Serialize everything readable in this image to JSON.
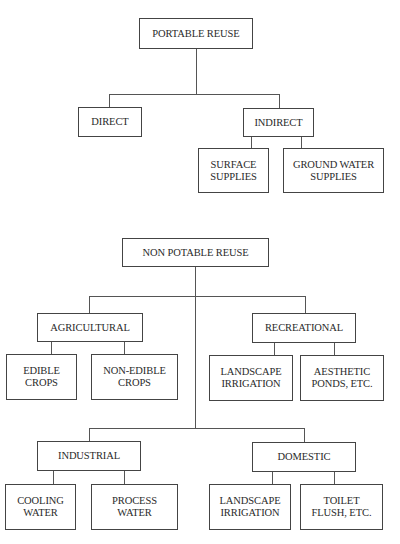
{
  "potable": {
    "root": "PORTABLE REUSE",
    "direct": "DIRECT",
    "indirect": "INDIRECT",
    "surface_supplies": "SURFACE\nSUPPLIES",
    "ground_water_supplies": "GROUND WATER\nSUPPLIES"
  },
  "non_potable": {
    "root": "NON POTABLE REUSE",
    "agricultural": {
      "label": "AGRICULTURAL",
      "children": [
        "EDIBLE\nCROPS",
        "NON-EDIBLE\nCROPS"
      ]
    },
    "recreational": {
      "label": "RECREATIONAL",
      "children": [
        "LANDSCAPE\nIRRIGATION",
        "AESTHETIC\nPONDS, ETC."
      ]
    },
    "industrial": {
      "label": "INDUSTRIAL",
      "children": [
        "COOLING\nWATER",
        "PROCESS\nWATER"
      ]
    },
    "domestic": {
      "label": "DOMESTIC",
      "children": [
        "LANDSCAPE\nIRRIGATION",
        "TOILET\nFLUSH, ETC."
      ]
    }
  }
}
